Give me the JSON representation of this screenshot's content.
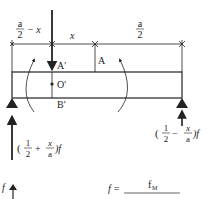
{
  "diagram": {
    "type": "simply-supported beam with point load",
    "dimensions": {
      "left_segment": {
        "num": "a",
        "den": "2",
        "suffix": "− x"
      },
      "offset": "x",
      "right_segment": {
        "num": "a",
        "den": "2"
      }
    },
    "points": {
      "A_prime": "A'",
      "A": "A",
      "O_prime": "O'",
      "B_prime": "B'"
    },
    "reactions": {
      "left": {
        "open": "(",
        "frac_num": "1",
        "frac_den": "2",
        "op": "+",
        "x_num": "x",
        "x_den": "a",
        "close": ")f"
      },
      "right": {
        "open": "(",
        "frac_num": "1",
        "frac_den": "2",
        "op": "−",
        "x_num": "x",
        "x_den": "a",
        "close": ")f"
      }
    },
    "bottom": {
      "f_axis_label": "f",
      "formula_lhs": "f =",
      "formula_num": "f",
      "formula_num_sub": "M"
    },
    "colors": {
      "ink": "#222222",
      "background": "#ffffff"
    }
  }
}
